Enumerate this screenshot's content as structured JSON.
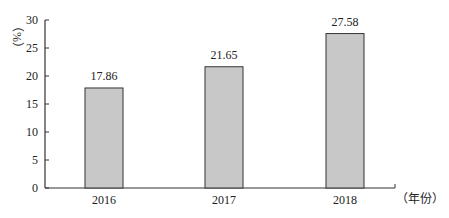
{
  "chart_data": {
    "type": "bar",
    "title": "",
    "xlabel": "（年份）",
    "ylabel": "（%）",
    "categories": [
      "2016",
      "2017",
      "2018"
    ],
    "values": [
      17.86,
      21.65,
      27.58
    ],
    "value_labels": [
      "17.86",
      "21.65",
      "27.58"
    ],
    "ylim": [
      0,
      30
    ],
    "yticks": [
      0,
      5,
      10,
      15,
      20,
      25,
      30
    ],
    "grid": false,
    "legend": null,
    "colors": {
      "bar_fill": "#c8c8c8",
      "bar_stroke": "#333333",
      "axis": "#333333"
    }
  }
}
